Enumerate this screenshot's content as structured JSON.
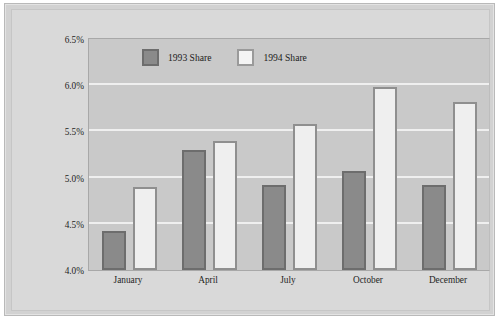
{
  "chart_data": {
    "type": "bar",
    "title": "",
    "xlabel": "",
    "ylabel": "",
    "categories": [
      "January",
      "April",
      "July",
      "October",
      "December"
    ],
    "series": [
      {
        "name": "1993 Share",
        "color": "#8a8a8a",
        "values": [
          4.42,
          5.3,
          4.92,
          5.07,
          4.92
        ]
      },
      {
        "name": "1994 Share",
        "color": "#efefef",
        "values": [
          4.9,
          5.4,
          5.58,
          5.98,
          5.82
        ]
      }
    ],
    "ylim": [
      4.0,
      6.5
    ],
    "ytick_labels": [
      "6.5%",
      "6.0%",
      "5.5%",
      "5.0%",
      "4.5%",
      "4.0%"
    ],
    "ytick_values": [
      6.5,
      6.0,
      5.5,
      5.0,
      4.5,
      4.0
    ],
    "yaxis_format": "percent",
    "grid": true,
    "legend_position": "top-left-inside",
    "plot_background": "#c9c9c9",
    "gridline_color": "#efefef"
  }
}
